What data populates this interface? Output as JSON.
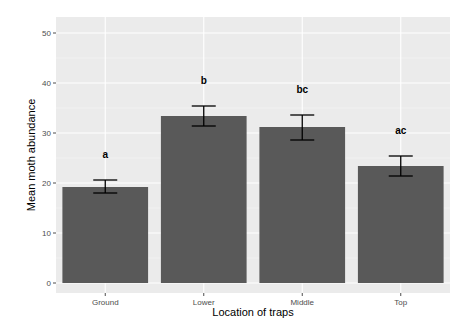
{
  "chart_data": {
    "type": "bar",
    "title": "",
    "xlabel": "Location of traps",
    "ylabel": "Mean moth abundance",
    "categories": [
      "Ground",
      "Lower",
      "Middle",
      "Top"
    ],
    "values": [
      19.2,
      33.4,
      31.2,
      23.4
    ],
    "error_upper": [
      20.6,
      35.4,
      33.6,
      25.4
    ],
    "error_lower": [
      18.0,
      31.4,
      28.6,
      21.4
    ],
    "significance_labels": [
      "a",
      "b",
      "bc",
      "ac"
    ],
    "ylim": [
      0,
      52
    ],
    "yticks": [
      0,
      10,
      20,
      30,
      40,
      50
    ],
    "grid": true,
    "legend": "none",
    "colors": {
      "bar": "#595959",
      "panel_background": "#ebebeb",
      "grid_major": "#ffffff",
      "grid_minor": "#f5f5f5",
      "error_bar": "#000000"
    }
  }
}
